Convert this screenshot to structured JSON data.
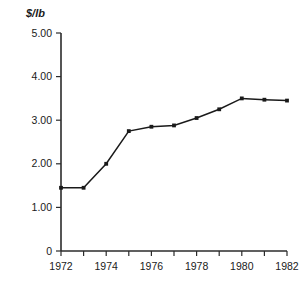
{
  "chart_data": {
    "type": "line",
    "title": "",
    "subtitle": "",
    "xlabel": "",
    "ylabel": "$/lb",
    "x": [
      1972,
      1973,
      1974,
      1975,
      1976,
      1977,
      1978,
      1979,
      1980,
      1981,
      1982
    ],
    "values": [
      1.45,
      1.45,
      2.0,
      2.75,
      2.85,
      2.88,
      3.05,
      3.25,
      3.5,
      3.47,
      3.45
    ],
    "series": [
      {
        "name": "",
        "values": [
          1.45,
          1.45,
          2.0,
          2.75,
          2.85,
          2.88,
          3.05,
          3.25,
          3.5,
          3.47,
          3.45
        ]
      }
    ],
    "xlim": [
      1972,
      1982
    ],
    "ylim": [
      0,
      5.0
    ],
    "x_tick_values": [
      1972,
      1973,
      1974,
      1975,
      1976,
      1977,
      1978,
      1979,
      1980,
      1981,
      1982
    ],
    "x_tick_labels": [
      "1972",
      "",
      "1974",
      "",
      "1976",
      "",
      "1978",
      "",
      "1980",
      "",
      "1982"
    ],
    "y_ticks": [
      0,
      1.0,
      2.0,
      3.0,
      4.0,
      5.0
    ],
    "y_tick_labels": [
      "0",
      "1.00",
      "2.00",
      "3.00",
      "4.00",
      "5.00"
    ],
    "grid": false,
    "legend": "none",
    "marker": "square",
    "line_color": "#1a1a1a",
    "axis_color": "#2b2b2b",
    "background_color": "#ffffff"
  }
}
